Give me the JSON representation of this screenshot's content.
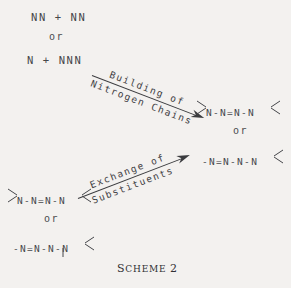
{
  "figure": {
    "caption_prefix": "S",
    "caption_rest": "CHEME",
    "caption_number": "2",
    "caption_full": "SCHEME 2",
    "background_color": "#f3f1ef",
    "ink_color": "#3a3b3e"
  },
  "reactants_top": {
    "line1": "NN + NN",
    "or": "or",
    "line2": "N + NNN"
  },
  "arrows": [
    {
      "id": "building-arrow",
      "label_top": "Building of",
      "label_bottom": "Nitrogen Chains",
      "direction": "down-right"
    },
    {
      "id": "exchange-arrow",
      "label_top": "Exchange of",
      "label_bottom": "Substituents",
      "direction": "up-right"
    }
  ],
  "products_right": {
    "structure1": "N-N=N-N",
    "or": "or",
    "structure2": "-N=N-N-N"
  },
  "reactants_bottom": {
    "structure1": "N-N=N-N",
    "or": "or",
    "structure2": "-N=N-N-N"
  }
}
